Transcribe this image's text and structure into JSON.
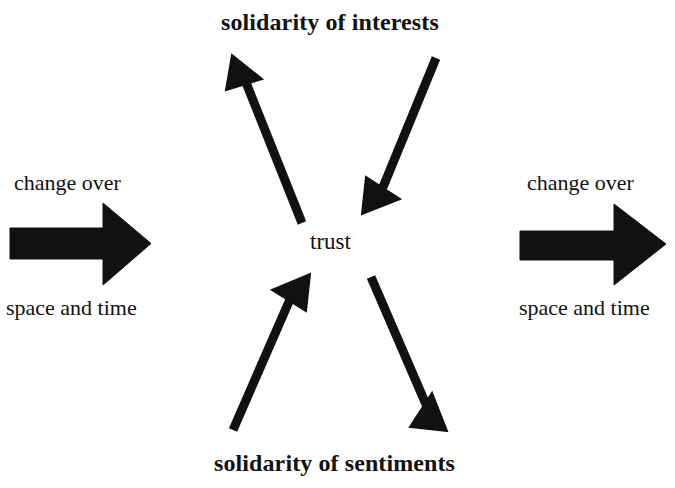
{
  "diagram": {
    "background_color": "#ffffff",
    "ink_color": "#111111",
    "center_node": {
      "label": "trust"
    },
    "top_node": {
      "label": "solidarity of interests"
    },
    "bottom_node": {
      "label": "solidarity of sentiments"
    },
    "left_group": {
      "caption_top": "change over",
      "caption_bottom": "space and time",
      "arrow_direction": "right"
    },
    "right_group": {
      "caption_top": "change over",
      "caption_bottom": "space and time",
      "arrow_direction": "right"
    },
    "connectors": [
      {
        "name": "trust-to-interests",
        "from": "trust",
        "to": "solidarity of interests",
        "direction": "up-left",
        "points_toward": "solidarity of interests"
      },
      {
        "name": "interests-to-trust",
        "from": "solidarity of interests",
        "to": "trust",
        "direction": "down-left",
        "points_toward": "trust"
      },
      {
        "name": "sentiments-to-trust",
        "from": "solidarity of sentiments",
        "to": "trust",
        "direction": "up-right",
        "points_toward": "trust"
      },
      {
        "name": "trust-to-sentiments",
        "from": "trust",
        "to": "solidarity of sentiments",
        "direction": "down-right",
        "points_toward": "solidarity of sentiments"
      }
    ]
  }
}
